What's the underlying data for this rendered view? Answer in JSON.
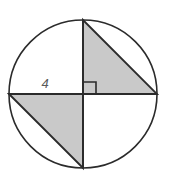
{
  "figure": {
    "background_color": "#ffffff",
    "canvas": {
      "width": 169,
      "height": 184
    },
    "circle": {
      "name": "outer-circle",
      "center_x": 83,
      "center_y": 94,
      "radius": 74,
      "stroke_color": "#2b2b2b",
      "stroke_width": 1.6,
      "fill_color": "#ffffff"
    },
    "diameters": {
      "vertical": {
        "x1": 83,
        "y1": 20,
        "x2": 83,
        "y2": 168,
        "stroke_color": "#2b2b2b",
        "stroke_width": 1.8
      },
      "horizontal": {
        "x1": 9,
        "y1": 94,
        "x2": 157,
        "y2": 94,
        "stroke_color": "#2b2b2b",
        "stroke_width": 1.8
      }
    },
    "shaded_triangles": [
      {
        "name": "upper-right-triangle",
        "points": "83,20 157,94 83,94",
        "fill_color": "#c9c9c9",
        "stroke_color": "#2b2b2b",
        "stroke_width": 1.8
      },
      {
        "name": "lower-left-triangle",
        "points": "9,94 83,168 83,94",
        "fill_color": "#c9c9c9",
        "stroke_color": "#2b2b2b",
        "stroke_width": 1.8
      }
    ],
    "right_angle_marker": {
      "name": "right-angle-marker",
      "points": "84,82 96,82 96,94",
      "stroke_color": "#2b2b2b",
      "stroke_width": 1.6,
      "size": 12
    },
    "labels": [
      {
        "name": "radius-length-label",
        "text": "4",
        "x": 45,
        "y": 88,
        "color": "#5a5a5a",
        "font_size": 13,
        "italic": true
      }
    ]
  }
}
